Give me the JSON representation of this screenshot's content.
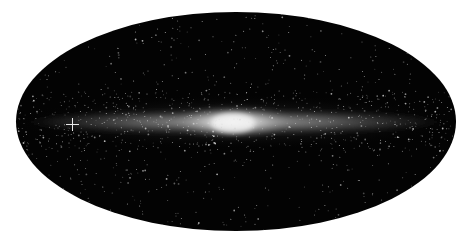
{
  "image": {
    "subject": "all-sky map of the Milky Way in elliptical (Mollweide/Aitoff) projection",
    "background_color": "#ffffff",
    "sky_color": "#030303",
    "band_color": "#cfcfcf",
    "bulge_color": "#f2f2f2",
    "marker": "cross-marker"
  }
}
